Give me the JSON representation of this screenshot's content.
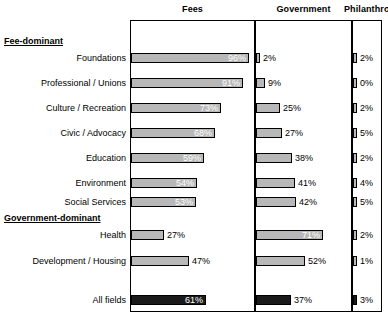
{
  "chart_data": {
    "type": "bar",
    "title": "",
    "xlabel": "",
    "ylabel": "",
    "xlim": [
      0,
      100
    ],
    "grid": false,
    "legend": "none",
    "orientation": "horizontal",
    "unit": "%",
    "columns": [
      "Fees",
      "Government",
      "Philanthropy"
    ],
    "sections": [
      {
        "header": "Fee-dominant",
        "categories": [
          "Foundations",
          "Professional / Unions",
          "Culture / Recreation",
          "Civic / Advocacy",
          "Education",
          "Environment",
          "Social Services"
        ],
        "values": {
          "Fees": [
            96,
            91,
            73,
            68,
            59,
            54,
            53
          ],
          "Government": [
            2,
            9,
            25,
            27,
            38,
            41,
            42
          ],
          "Philanthropy": [
            2,
            0,
            2,
            5,
            2,
            4,
            5
          ]
        }
      },
      {
        "header": "Government-dominant",
        "categories": [
          "Health",
          "Development / Housing"
        ],
        "values": {
          "Fees": [
            27,
            47
          ],
          "Government": [
            71,
            52
          ],
          "Philanthropy": [
            2,
            1
          ]
        }
      },
      {
        "header": "",
        "categories": [
          "All fields"
        ],
        "emphasis": true,
        "values": {
          "Fees": [
            61
          ],
          "Government": [
            37
          ],
          "Philanthropy": [
            3
          ]
        }
      }
    ],
    "colors": {
      "bar_fill": "#b8b8b8",
      "bar_fill_total": "#1a1a1a",
      "bar_stroke": "#000000",
      "frame": "#000000",
      "background": "#ffffff"
    }
  },
  "headers": {
    "fees": "Fees",
    "government": "Government",
    "philanthropy": "Philanthropy"
  },
  "sections": {
    "fee_dominant": "Fee-dominant",
    "government_dominant": "Government-dominant"
  },
  "rows": {
    "foundations": "Foundations",
    "professional_unions": "Professional / Unions",
    "culture_recreation": "Culture / Recreation",
    "civic_advocacy": "Civic / Advocacy",
    "education": "Education",
    "environment": "Environment",
    "social_services": "Social Services",
    "health": "Health",
    "development_housing": "Development / Housing",
    "all_fields": "All fields"
  },
  "labels": {
    "fees": {
      "foundations": "96%",
      "professional_unions": "91%",
      "culture_recreation": "73%",
      "civic_advocacy": "68%",
      "education": "59%",
      "environment": "54%",
      "social_services": "53%",
      "health": "27%",
      "development_housing": "47%",
      "all_fields": "61%"
    },
    "government": {
      "foundations": "2%",
      "professional_unions": "9%",
      "culture_recreation": "25%",
      "civic_advocacy": "27%",
      "education": "38%",
      "environment": "41%",
      "social_services": "42%",
      "health": "71%",
      "development_housing": "52%",
      "all_fields": "37%"
    },
    "philanthropy": {
      "foundations": "2%",
      "professional_unions": "0%",
      "culture_recreation": "2%",
      "civic_advocacy": "5%",
      "education": "2%",
      "environment": "4%",
      "social_services": "5%",
      "health": "2%",
      "development_housing": "1%",
      "all_fields": "3%"
    }
  }
}
